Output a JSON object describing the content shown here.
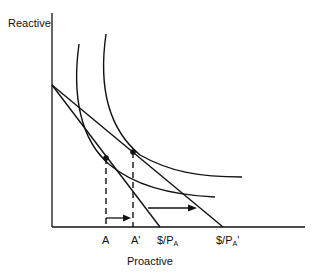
{
  "diagram": {
    "type": "indifference-curve-budget-shift",
    "y_axis_label": "Reactive",
    "x_axis_label": "Proactive",
    "x_ticks": [
      {
        "id": "A",
        "label": "A"
      },
      {
        "id": "A_prime",
        "label": "A'"
      },
      {
        "id": "budget1",
        "label_main": "$/P",
        "label_sub": "A",
        "label_suffix": ""
      },
      {
        "id": "budget2",
        "label_main": "$/P",
        "label_sub": "A",
        "label_suffix": "'"
      }
    ],
    "elements": {
      "budget_lines": 2,
      "indifference_curves": 2,
      "optimal_points": [
        "A",
        "A'"
      ],
      "arrows": [
        "shift from A to A'",
        "budget line pivot outward"
      ]
    },
    "colors": {
      "line": "#111111",
      "background": "#ffffff"
    }
  }
}
